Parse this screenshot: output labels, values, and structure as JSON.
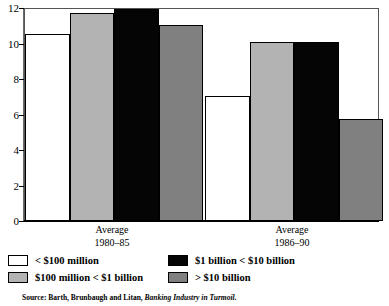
{
  "chart_data": {
    "type": "bar",
    "title": "",
    "subtitle": "",
    "xlabel": "",
    "ylabel": "",
    "ylim": [
      0,
      12
    ],
    "yticks": [
      0,
      2,
      4,
      6,
      8,
      10,
      12
    ],
    "ytick_labels": [
      "0",
      "2",
      "4",
      "6",
      "8",
      "10",
      "12"
    ],
    "grid": false,
    "legend_position": "below-plot",
    "categories": [
      "Average 1980–85",
      "Average 1986–90"
    ],
    "category_lines": [
      [
        "Average",
        "1980–85"
      ],
      [
        "Average",
        "1986–90"
      ]
    ],
    "series": [
      {
        "name": "< $100 million",
        "color": "#ffffff",
        "values": [
          10.6,
          7.1
        ]
      },
      {
        "name": "$100 million < $1 billion",
        "color": "#b3b3b3",
        "values": [
          11.75,
          10.15
        ]
      },
      {
        "name": "$1 billion < $10 billion",
        "color": "#050505",
        "values": [
          12.0,
          10.15
        ]
      },
      {
        "name": "> $10 billion",
        "color": "#808080",
        "values": [
          11.1,
          5.8
        ]
      }
    ],
    "source_note": {
      "prefix": "Source: Barth, Brunbaugh and Litan, ",
      "italic_title": "Banking Industry in Turmoil",
      "suffix": "."
    }
  },
  "legend": {
    "rows": [
      [
        {
          "label": "< $100 million",
          "color": "#ffffff"
        },
        {
          "label": "$1 billion < $10 billion",
          "color": "#050505"
        }
      ],
      [
        {
          "label": "$100 million < $1 billion",
          "color": "#b3b3b3"
        },
        {
          "label": "> $10 billion",
          "color": "#808080"
        }
      ]
    ]
  }
}
